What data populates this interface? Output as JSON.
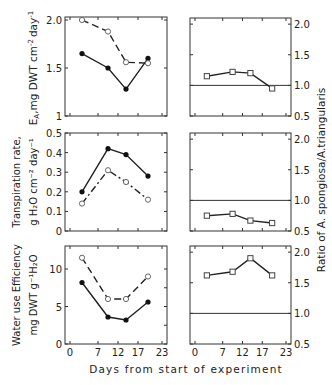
{
  "figure": {
    "x_axis_label": "Days from start of experiment",
    "right_axis_label": "Ratio of A. spongiosa/A.triangularis",
    "x_ticks": [
      0,
      7,
      12,
      17,
      23
    ]
  },
  "chart_data": [
    {
      "type": "line",
      "panel": "top-left",
      "ylabel": "E_A, mg DWT cm^-2 day^-1",
      "ylabel_main": "E",
      "ylabel_sub": "A",
      "ylabel_rest": ",mg DWT cm",
      "ylabel_sup1": "-2",
      "ylabel_rest2": "day",
      "ylabel_sup2": "-1",
      "ylim": [
        1,
        2.0
      ],
      "yticks": [
        1,
        1.5,
        2.0
      ],
      "ytick_labels": [
        "1",
        "1.5",
        "2.0"
      ],
      "x": [
        3,
        9.5,
        14,
        19.5
      ],
      "series": [
        {
          "name": "filled circles (solid line)",
          "marker": "filled-circle",
          "line": "solid",
          "values": [
            1.65,
            1.5,
            1.28,
            1.6
          ]
        },
        {
          "name": "open circles (dashed line)",
          "marker": "open-circle",
          "line": "dashed",
          "values": [
            2.0,
            1.88,
            1.56,
            1.55
          ]
        }
      ]
    },
    {
      "type": "line",
      "panel": "top-right",
      "ylabel": "Ratio",
      "ylim": [
        0.5,
        2.2
      ],
      "yticks": [
        0.5,
        1.0,
        1.5,
        2.0
      ],
      "ytick_labels": [
        "0.5",
        "1.0",
        "1.5",
        "2.0"
      ],
      "reference_line": 1.0,
      "x": [
        3,
        9.5,
        14,
        19.5
      ],
      "series": [
        {
          "name": "ratio",
          "marker": "open-square",
          "line": "solid",
          "values": [
            1.15,
            1.22,
            1.2,
            0.95
          ]
        }
      ]
    },
    {
      "type": "line",
      "panel": "middle-left",
      "ylabel": "Transpiration rate, g H2O cm^-2 day^-1",
      "ylabel_line1": "Transpiration rate,",
      "ylabel_line2": "g H₂O cm⁻² day⁻¹",
      "ylim": [
        0,
        0.5
      ],
      "yticks": [
        0,
        0.1,
        0.2,
        0.3,
        0.4,
        0.5
      ],
      "ytick_labels": [
        "0",
        "0.1",
        "0.2",
        "0.3",
        "0.4",
        "0.5"
      ],
      "x": [
        3,
        9.5,
        14,
        19.5
      ],
      "series": [
        {
          "name": "filled circles (solid line)",
          "marker": "filled-circle",
          "line": "solid",
          "values": [
            0.2,
            0.42,
            0.39,
            0.28
          ]
        },
        {
          "name": "open circles (dash-dot line)",
          "marker": "open-circle",
          "line": "dashdot",
          "values": [
            0.14,
            0.31,
            0.25,
            0.16
          ]
        }
      ]
    },
    {
      "type": "line",
      "panel": "middle-right",
      "ylabel": "Ratio",
      "ylim": [
        0.5,
        2.2
      ],
      "yticks": [
        0.5,
        1.0,
        1.5,
        2.0
      ],
      "ytick_labels": [
        "0.5",
        "1.0",
        "1.5",
        "2.0"
      ],
      "reference_line": 1.0,
      "x": [
        3,
        9.5,
        14,
        19.5
      ],
      "series": [
        {
          "name": "ratio",
          "marker": "open-square",
          "line": "solid",
          "values": [
            0.75,
            0.78,
            0.67,
            0.63
          ]
        }
      ]
    },
    {
      "type": "line",
      "panel": "bottom-left",
      "ylabel": "Water use Efficiency mg DWT g^-1 H2O",
      "ylabel_line1": "Water use Efficiency",
      "ylabel_line2": "mg DWT g⁻¹H₂O",
      "ylim": [
        0,
        13
      ],
      "yticks": [
        0,
        5,
        10
      ],
      "ytick_labels": [
        "0",
        "5",
        "10"
      ],
      "x": [
        3,
        9.5,
        14,
        19.5
      ],
      "series": [
        {
          "name": "filled circles (solid line)",
          "marker": "filled-circle",
          "line": "solid",
          "values": [
            8.2,
            3.6,
            3.2,
            5.6
          ]
        },
        {
          "name": "open circles (dashed line)",
          "marker": "open-circle",
          "line": "dashed",
          "values": [
            11.5,
            6.0,
            6.0,
            9.0
          ]
        }
      ]
    },
    {
      "type": "line",
      "panel": "bottom-right",
      "ylabel": "Ratio",
      "ylim": [
        0.5,
        2.2
      ],
      "yticks": [
        0.5,
        1.0,
        1.5,
        2.0
      ],
      "ytick_labels": [
        "0.5",
        "1.0",
        "1.5",
        "2.0"
      ],
      "reference_line": 1.0,
      "x": [
        3,
        9.5,
        14,
        19.5
      ],
      "series": [
        {
          "name": "ratio",
          "marker": "open-square",
          "line": "solid",
          "values": [
            1.62,
            1.68,
            1.9,
            1.62
          ]
        }
      ]
    }
  ]
}
